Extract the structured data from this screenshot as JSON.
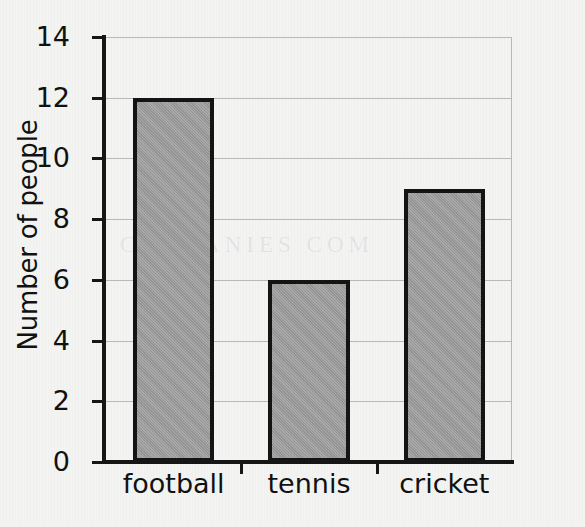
{
  "chart_data": {
    "type": "bar",
    "title": "",
    "xlabel": "",
    "ylabel": "Number of people",
    "categories": [
      "football",
      "tennis",
      "cricket"
    ],
    "values": [
      12,
      6,
      9
    ],
    "ylim": [
      0,
      14
    ],
    "ytick_labels": [
      "0",
      "2",
      "4",
      "6",
      "8",
      "10",
      "12",
      "14"
    ],
    "ytick_values": [
      0,
      2,
      4,
      6,
      8,
      10,
      12,
      14
    ],
    "grid": "horizontal",
    "legend": "none",
    "bar_fill_color": "#9c9c9c",
    "bar_outline_color": "#141414",
    "axis_color": "#161616",
    "gridline_color": "#b9b9b9",
    "background_color": "#f3f3f2"
  },
  "artifacts": {
    "bleed_through_text": "COMPANIES COM"
  }
}
